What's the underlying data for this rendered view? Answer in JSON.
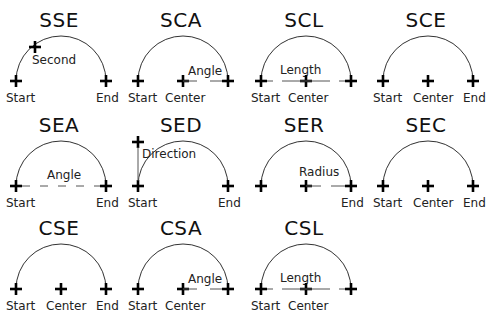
{
  "diagram": {
    "cells": [
      {
        "code": "SSE",
        "row": 0,
        "col": 0,
        "points": [
          "Start",
          "Second",
          "End"
        ],
        "labels": [
          {
            "text": "Start",
            "pos": "start"
          },
          {
            "text": "End",
            "pos": "end"
          },
          {
            "text": "Second",
            "pos": "second"
          }
        ]
      },
      {
        "code": "SCA",
        "row": 0,
        "col": 1,
        "points": [
          "Start",
          "Center"
        ],
        "measure": "Angle",
        "labels": [
          {
            "text": "Start",
            "pos": "start"
          },
          {
            "text": "Center",
            "pos": "center"
          },
          {
            "text": "Angle",
            "pos": "angle"
          }
        ]
      },
      {
        "code": "SCL",
        "row": 0,
        "col": 2,
        "points": [
          "Start",
          "Center"
        ],
        "measure": "Length",
        "labels": [
          {
            "text": "Start",
            "pos": "start"
          },
          {
            "text": "Center",
            "pos": "center"
          },
          {
            "text": "Length",
            "pos": "length"
          }
        ]
      },
      {
        "code": "SCE",
        "row": 0,
        "col": 3,
        "points": [
          "Start",
          "Center",
          "End"
        ],
        "labels": [
          {
            "text": "Start",
            "pos": "start"
          },
          {
            "text": "Center",
            "pos": "center"
          },
          {
            "text": "End",
            "pos": "end"
          }
        ]
      },
      {
        "code": "SEA",
        "row": 1,
        "col": 0,
        "points": [
          "Start",
          "End"
        ],
        "measure": "Angle",
        "labels": [
          {
            "text": "Start",
            "pos": "start"
          },
          {
            "text": "End",
            "pos": "end"
          },
          {
            "text": "Angle",
            "pos": "angle"
          }
        ]
      },
      {
        "code": "SED",
        "row": 1,
        "col": 1,
        "points": [
          "Start",
          "End"
        ],
        "measure": "Direction",
        "labels": [
          {
            "text": "Start",
            "pos": "start"
          },
          {
            "text": "End",
            "pos": "end"
          },
          {
            "text": "Direction",
            "pos": "direction"
          }
        ]
      },
      {
        "code": "SER",
        "row": 1,
        "col": 2,
        "points": [
          "Start",
          "End"
        ],
        "measure": "Radius",
        "labels": [
          {
            "text": "End",
            "pos": "end"
          },
          {
            "text": "Radius",
            "pos": "radius"
          }
        ]
      },
      {
        "code": "SEC",
        "row": 1,
        "col": 3,
        "points": [
          "Start",
          "Center",
          "End"
        ],
        "labels": [
          {
            "text": "Start",
            "pos": "start"
          },
          {
            "text": "Center",
            "pos": "center"
          },
          {
            "text": "End",
            "pos": "end"
          }
        ]
      },
      {
        "code": "CSE",
        "row": 2,
        "col": 0,
        "points": [
          "Start",
          "Center",
          "End"
        ],
        "labels": [
          {
            "text": "Start",
            "pos": "start"
          },
          {
            "text": "Center",
            "pos": "center"
          },
          {
            "text": "End",
            "pos": "end"
          }
        ]
      },
      {
        "code": "CSA",
        "row": 2,
        "col": 1,
        "points": [
          "Start",
          "Center"
        ],
        "measure": "Angle",
        "labels": [
          {
            "text": "Start",
            "pos": "start"
          },
          {
            "text": "Center",
            "pos": "center"
          },
          {
            "text": "Angle",
            "pos": "angle"
          }
        ]
      },
      {
        "code": "CSL",
        "row": 2,
        "col": 2,
        "points": [
          "Start",
          "Center"
        ],
        "measure": "Length",
        "labels": [
          {
            "text": "Start",
            "pos": "start"
          },
          {
            "text": "Center",
            "pos": "center"
          },
          {
            "text": "Length",
            "pos": "length"
          }
        ]
      }
    ]
  }
}
